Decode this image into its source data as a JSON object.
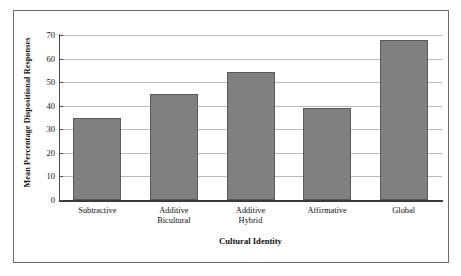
{
  "chart_data": {
    "type": "bar",
    "title": "",
    "xlabel": "Cultural Identity",
    "ylabel": "Mean Percentage Dispositional Responses",
    "categories": [
      "Subtractive",
      "Additive Bicultural",
      "Additive Hybrid",
      "Affirmative",
      "Global"
    ],
    "category_lines": [
      [
        "Subtractive"
      ],
      [
        "Additive",
        "Bicultural"
      ],
      [
        "Additive",
        "Hybrid"
      ],
      [
        "Affirmative"
      ],
      [
        "Global"
      ]
    ],
    "values": [
      35,
      45,
      54.5,
      39,
      68
    ],
    "ylim": [
      0,
      70
    ],
    "ytick_labels": [
      "70",
      "60",
      "50",
      "40",
      "30",
      "20",
      "10",
      "0"
    ],
    "ytick_values": [
      70,
      60,
      50,
      40,
      30,
      20,
      10,
      0
    ],
    "grid": true,
    "legend": "none",
    "bar_color": "#808080",
    "bar_border_color": "#5a5a5a",
    "gridline_color": "#b9b9b9",
    "axis_color": "#3a3a3a",
    "frame_color": "#6e6e6e",
    "background": "#ffffff"
  }
}
